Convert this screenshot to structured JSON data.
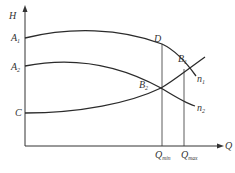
{
  "diagram": {
    "axes": {
      "y_label": "H",
      "x_label": "Q"
    },
    "y_points": {
      "a1": {
        "main": "A",
        "sub": "1"
      },
      "a2": {
        "main": "A",
        "sub": "2"
      },
      "c": {
        "main": "C"
      }
    },
    "points": {
      "d": {
        "main": "D"
      },
      "b1": {
        "main": "B",
        "sub": "1"
      },
      "b2": {
        "main": "B",
        "sub": "2"
      }
    },
    "curves": {
      "n1": {
        "main": "n",
        "sub": "1"
      },
      "n2": {
        "main": "n",
        "sub": "2"
      }
    },
    "x_ticks": {
      "qmin": {
        "main": "Q",
        "sub": "min"
      },
      "qmax": {
        "main": "Q",
        "sub": "max"
      }
    },
    "line_color": "#2b2b2b"
  }
}
